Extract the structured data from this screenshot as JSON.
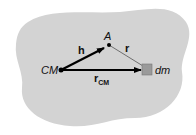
{
  "diagram": {
    "labels": {
      "cm": "CM",
      "a": "A",
      "h": "h",
      "r": "r",
      "rcm_main": "r",
      "rcm_sub": "CM",
      "dm": "dm"
    },
    "colors": {
      "blob": "#d3d3d3",
      "arrow": "#000000",
      "thin_line": "#555555",
      "mass_element": "#9a9a9a"
    }
  }
}
